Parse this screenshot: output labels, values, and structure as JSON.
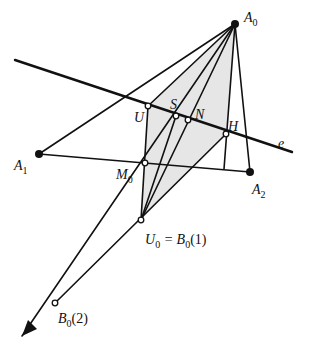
{
  "diagram": {
    "type": "projective-geometry-construction",
    "colors": {
      "line": "#111111",
      "shade": "#e6e6e6",
      "background": "#ffffff"
    },
    "points": {
      "A0": {
        "label": "A",
        "sub": "0",
        "suffix": "",
        "x": 235,
        "y": 24,
        "style": "solid",
        "lx": 244,
        "ly": 22
      },
      "A1": {
        "label": "A",
        "sub": "1",
        "suffix": "",
        "x": 39,
        "y": 154,
        "style": "solid",
        "lx": 14,
        "ly": 170
      },
      "A2": {
        "label": "A",
        "sub": "2",
        "suffix": "",
        "x": 250,
        "y": 172,
        "style": "solid",
        "lx": 252,
        "ly": 194
      },
      "U": {
        "label": "U",
        "sub": "",
        "suffix": "",
        "x": 148,
        "y": 106,
        "style": "open",
        "lx": 134,
        "ly": 122
      },
      "S": {
        "label": "S",
        "sub": "",
        "suffix": "",
        "x": 176,
        "y": 116,
        "style": "open",
        "lx": 170,
        "ly": 109
      },
      "N": {
        "label": "N",
        "sub": "",
        "suffix": "",
        "x": 188,
        "y": 120,
        "style": "open",
        "lx": 195,
        "ly": 119
      },
      "H": {
        "label": "H",
        "sub": "",
        "suffix": "",
        "x": 226,
        "y": 134,
        "style": "open",
        "lx": 228,
        "ly": 131
      },
      "M0": {
        "label": "M",
        "sub": "0",
        "suffix": "",
        "x": 145,
        "y": 163,
        "style": "open",
        "lx": 116,
        "ly": 179
      },
      "U0": {
        "label": "U",
        "sub": "0",
        "suffix": " = B",
        "sub2": "0",
        "suffix2": "(1)",
        "x": 141,
        "y": 220,
        "style": "open",
        "lx": 145,
        "ly": 244
      },
      "B02": {
        "label": "B",
        "sub": "0",
        "suffix": "(2)",
        "x": 55,
        "y": 303,
        "style": "open",
        "lx": 58,
        "ly": 323
      }
    },
    "line_e": {
      "label": "e",
      "x1": 15,
      "y1": 60,
      "x2": 292,
      "y2": 152,
      "lx": 278,
      "ly": 148
    },
    "arrow_tip": {
      "x": 22,
      "y": 336
    },
    "caption": ""
  }
}
